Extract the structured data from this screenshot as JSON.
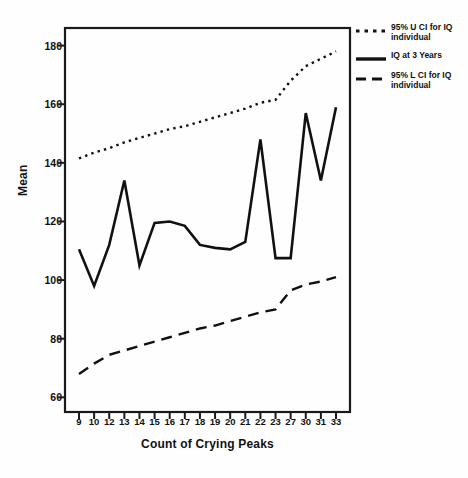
{
  "chart_data": {
    "type": "line",
    "title": "",
    "xlabel": "Count of Crying Peaks",
    "ylabel": "Mean",
    "categories": [
      "9",
      "10",
      "12",
      "13",
      "14",
      "15",
      "16",
      "17",
      "18",
      "19",
      "20",
      "21",
      "22",
      "23",
      "27",
      "30",
      "31",
      "33"
    ],
    "ylim": [
      55,
      186
    ],
    "yticks": [
      60,
      80,
      100,
      120,
      140,
      160,
      180
    ],
    "grid": false,
    "legend_position": "right",
    "series": [
      {
        "name": "95% U CI for IQ individual",
        "style": "dotted",
        "values": [
          141.5,
          143.5,
          145.0,
          147.0,
          148.5,
          150.0,
          151.5,
          152.5,
          154.0,
          155.5,
          157.0,
          158.5,
          160.5,
          161.5,
          168.0,
          173.0,
          175.5,
          178.0
        ]
      },
      {
        "name": "IQ at 3 Years",
        "style": "solid",
        "values": [
          110.5,
          98.0,
          112.0,
          134.0,
          105.0,
          119.5,
          120.0,
          118.5,
          112.0,
          111.0,
          110.5,
          113.0,
          148.0,
          107.5,
          107.5,
          157.0,
          134.0,
          159.0
        ]
      },
      {
        "name": "95% L CI for IQ individual",
        "style": "dashed",
        "values": [
          68.0,
          71.5,
          74.5,
          76.0,
          77.5,
          79.0,
          80.5,
          82.0,
          83.5,
          84.5,
          86.0,
          87.5,
          89.0,
          90.0,
          96.5,
          98.5,
          99.5,
          101.0
        ]
      }
    ]
  },
  "legend": {
    "items": [
      {
        "label": "95% U CI for IQ individual",
        "style": "dotted"
      },
      {
        "label": "IQ at 3 Years",
        "style": "solid"
      },
      {
        "label": "95% L CI for IQ individual",
        "style": "dashed"
      }
    ]
  }
}
